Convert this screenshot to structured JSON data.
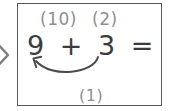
{
  "worksheet": {
    "annotations": {
      "left_note": "(10)",
      "right_note": "(2)",
      "bottom_note": "(1)"
    },
    "equation": {
      "first_addend": "9",
      "operator": "+",
      "second_addend": "3",
      "equals": "=",
      "sum": "12",
      "full_text": "9 + 3 = 12"
    },
    "arrow": {
      "label": "carry-arrow",
      "direction": "right-to-left-curved"
    }
  },
  "icons": {
    "left_chevron": "chevron-right-icon"
  },
  "colors": {
    "box_border": "#58595b",
    "equation_text": "#3b3c3e",
    "annotation_text": "#8d8f91",
    "arrow_stroke": "#4a4b4d",
    "background": "#ffffff"
  }
}
